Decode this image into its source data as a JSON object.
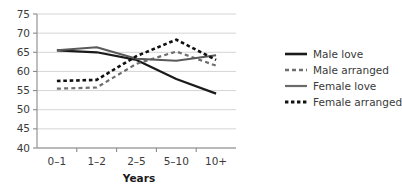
{
  "chart_data": {
    "type": "line",
    "title": "",
    "xlabel": "Years",
    "ylabel": "",
    "categories": [
      "0–1",
      "1–2",
      "2–5",
      "5–10",
      "10+"
    ],
    "ylim": [
      40,
      75
    ],
    "yticks": [
      40,
      45,
      50,
      55,
      60,
      65,
      70,
      75
    ],
    "ytick_labels": [
      "40",
      "45",
      "50",
      "55",
      "60",
      "65",
      "70",
      "75"
    ],
    "grid": true,
    "legend_position": "right",
    "series": [
      {
        "name": "Male love",
        "values": [
          65.5,
          65.0,
          63.0,
          58.0,
          54.2
        ],
        "color": "#1a1a1a",
        "style": "solid",
        "width": 2.2
      },
      {
        "name": "Male arranged",
        "values": [
          55.5,
          55.8,
          62.0,
          65.2,
          61.5
        ],
        "color": "#6e6e6e",
        "style": "dashed",
        "width": 2.2
      },
      {
        "name": "Female love",
        "values": [
          65.5,
          66.3,
          63.3,
          62.8,
          64.2
        ],
        "color": "#5a5a5a",
        "style": "solid",
        "width": 2.0
      },
      {
        "name": "Female arranged",
        "values": [
          57.5,
          57.8,
          64.0,
          68.3,
          63.0
        ],
        "color": "#101010",
        "style": "dashed",
        "width": 2.6
      }
    ]
  },
  "axes": {
    "x_axis_title": "Years",
    "y_axis_title": ""
  },
  "legend": {
    "items": [
      {
        "label": "Male love"
      },
      {
        "label": "Male arranged"
      },
      {
        "label": "Female love"
      },
      {
        "label": "Female arranged"
      }
    ]
  }
}
